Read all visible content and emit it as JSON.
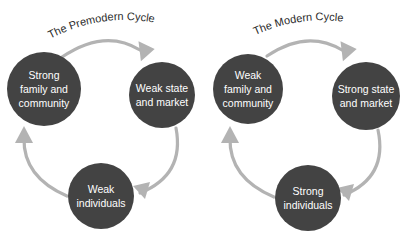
{
  "figure": {
    "background_color": "#ffffff",
    "node_fill_color": "#434343",
    "node_text_color": "#ffffff",
    "arrow_color": "#b3b3b3",
    "title_color": "#2b2b2b"
  },
  "cycles": [
    {
      "id": "premodern",
      "title": "The Premodern Cycle",
      "nodes": [
        {
          "id": "premodern-family",
          "line1": "Strong",
          "line2": "family and",
          "line3": "community"
        },
        {
          "id": "premodern-state",
          "line1": "Weak state",
          "line2": "and market",
          "line3": ""
        },
        {
          "id": "premodern-individuals",
          "line1": "Weak",
          "line2": "individuals",
          "line3": ""
        }
      ],
      "arrows": [
        {
          "id": "premodern-arrow-family-to-state",
          "from": "premodern-family",
          "to": "premodern-state"
        },
        {
          "id": "premodern-arrow-state-to-individuals",
          "from": "premodern-state",
          "to": "premodern-individuals"
        },
        {
          "id": "premodern-arrow-individuals-to-family",
          "from": "premodern-individuals",
          "to": "premodern-family"
        }
      ]
    },
    {
      "id": "modern",
      "title": "The Modern Cycle",
      "nodes": [
        {
          "id": "modern-family",
          "line1": "Weak",
          "line2": "family and",
          "line3": "community"
        },
        {
          "id": "modern-state",
          "line1": "Strong state",
          "line2": "and market",
          "line3": ""
        },
        {
          "id": "modern-individuals",
          "line1": "Strong",
          "line2": "individuals",
          "line3": ""
        }
      ],
      "arrows": [
        {
          "id": "modern-arrow-family-to-state",
          "from": "modern-family",
          "to": "modern-state"
        },
        {
          "id": "modern-arrow-state-to-individuals",
          "from": "modern-state",
          "to": "modern-individuals"
        },
        {
          "id": "modern-arrow-individuals-to-family",
          "from": "modern-individuals",
          "to": "modern-family"
        }
      ]
    }
  ]
}
